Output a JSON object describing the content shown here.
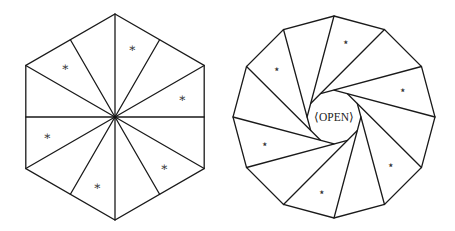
{
  "figure": {
    "width": 455,
    "height": 231,
    "stroke_color": "#1a1a1a",
    "left": {
      "name": "hexagon-fan",
      "shape": "hexagon",
      "center": [
        115,
        117
      ],
      "radius": 103,
      "sides": 6,
      "start_angle_deg": -90,
      "spokes": "center-to-vertices-and-edge-midpoints",
      "mark_glyph": "∗",
      "mark_size": 12,
      "marks": [
        [
          132,
          48
        ],
        [
          182,
          98
        ],
        [
          164,
          167
        ],
        [
          97,
          186
        ],
        [
          47,
          136
        ],
        [
          65,
          67
        ]
      ]
    },
    "right": {
      "name": "dodecagon-pinwheel",
      "shape": "dodecagon",
      "center": [
        334,
        117
      ],
      "radius": 101,
      "sides": 12,
      "start_angle_deg": -90,
      "inner_radius": 26,
      "mark_glyph": "⋆",
      "mark_size": 12,
      "marks": [
        [
          346,
          42
        ],
        [
          403,
          90
        ],
        [
          391,
          165
        ],
        [
          322,
          192
        ],
        [
          265,
          144
        ],
        [
          277,
          69
        ]
      ],
      "center_label": "⟨OPEN⟩"
    }
  }
}
